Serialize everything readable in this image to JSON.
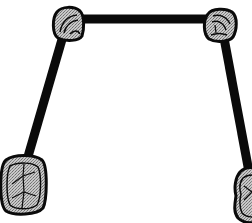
{
  "diagram": {
    "colors": {
      "background": "#ffffff",
      "wire": "#0a0a0a",
      "tooth_fill": "#bdbdbd",
      "tooth_outline": "#0a0a0a"
    },
    "teeth": [
      {
        "id": "top-left",
        "kind": "premolar",
        "cx": 67,
        "cy": 24
      },
      {
        "id": "top-right",
        "kind": "premolar",
        "cx": 219,
        "cy": 25
      },
      {
        "id": "bottom-left",
        "kind": "molar",
        "cx": 23,
        "cy": 185
      },
      {
        "id": "bottom-right",
        "kind": "molar",
        "cx": 250,
        "cy": 196
      }
    ],
    "wires": [
      {
        "id": "top-bar",
        "from": "top-left",
        "to": "top-right"
      },
      {
        "id": "left-bar",
        "from": "top-left",
        "to": "bottom-left"
      },
      {
        "id": "right-bar",
        "from": "top-right",
        "to": "bottom-right"
      }
    ]
  }
}
